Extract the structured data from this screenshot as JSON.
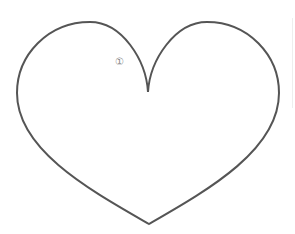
{
  "figure": {
    "shape": "heart-outline",
    "stroke_color": "#555555",
    "fill_color": "#ffffff",
    "background": "#ffffff"
  },
  "annotation": {
    "label": "①"
  }
}
